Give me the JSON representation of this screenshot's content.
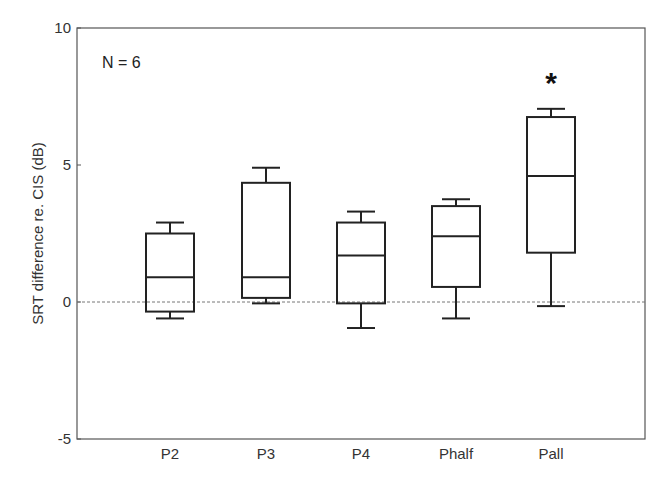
{
  "chart_data": {
    "type": "box",
    "title": "",
    "xlabel": "",
    "ylabel": "SRT difference re. CIS (dB)",
    "ylim": [
      -5,
      10
    ],
    "yticks": [
      10,
      5,
      0,
      -5
    ],
    "grid": false,
    "reference_line": {
      "y": 0,
      "style": "dashed"
    },
    "annotation": "N = 6",
    "categories": [
      "P2",
      "P3",
      "P4",
      "Phalf",
      "Pall"
    ],
    "boxes": [
      {
        "label": "P2",
        "whisker_low": -0.6,
        "q1": -0.35,
        "median": 0.9,
        "q3": 2.5,
        "whisker_high": 2.9,
        "significant": false
      },
      {
        "label": "P3",
        "whisker_low": -0.05,
        "q1": 0.15,
        "median": 0.9,
        "q3": 4.35,
        "whisker_high": 4.9,
        "significant": false
      },
      {
        "label": "P4",
        "whisker_low": -0.95,
        "q1": -0.05,
        "median": 1.7,
        "q3": 2.9,
        "whisker_high": 3.3,
        "significant": false
      },
      {
        "label": "Phalf",
        "whisker_low": -0.6,
        "q1": 0.55,
        "median": 2.4,
        "q3": 3.5,
        "whisker_high": 3.75,
        "significant": false
      },
      {
        "label": "Pall",
        "whisker_low": -0.15,
        "q1": 1.8,
        "median": 4.6,
        "q3": 6.75,
        "whisker_high": 7.05,
        "significant": true
      }
    ],
    "significance_marker": "*"
  }
}
